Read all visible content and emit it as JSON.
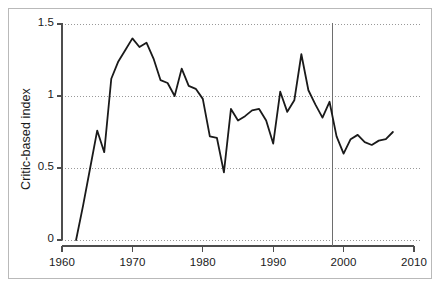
{
  "chart_data": {
    "type": "line",
    "title": "",
    "subtitle": "",
    "xlabel": "",
    "ylabel": "Critic-based index",
    "xlim": [
      1960,
      2010
    ],
    "ylim": [
      0,
      1.5
    ],
    "xticks": [
      1960,
      1970,
      1980,
      1990,
      2000,
      2010
    ],
    "xtick_labels": [
      "1960",
      "1970",
      "1980",
      "1990",
      "2000",
      "2010"
    ],
    "yticks": [
      0,
      0.5,
      1,
      1.5
    ],
    "ytick_labels": [
      "0",
      "0.5",
      "1",
      "1.5"
    ],
    "grid": "horizontal-dotted",
    "legend": "none",
    "line_color": "#1a1a1a",
    "grid_color": "#999999",
    "axis_color": "#4d4d4d",
    "frame_color": "#b9b9b9",
    "background": "#ffffff",
    "annotations": [
      {
        "name": "vertical-reference-line",
        "type": "vline",
        "x": 1998.4,
        "color": "#6e6e6e",
        "label": ""
      }
    ],
    "x": [
      1962,
      1963,
      1964,
      1965,
      1966,
      1967,
      1968,
      1969,
      1970,
      1971,
      1972,
      1973,
      1974,
      1975,
      1976,
      1977,
      1978,
      1979,
      1980,
      1981,
      1982,
      1983,
      1984,
      1985,
      1986,
      1987,
      1988,
      1989,
      1990,
      1991,
      1992,
      1993,
      1994,
      1995,
      1996,
      1997,
      1998,
      1999,
      2000,
      2001,
      2002,
      2003,
      2004,
      2005,
      2006,
      2007
    ],
    "values": [
      0.0,
      0.24,
      0.5,
      0.76,
      0.61,
      1.12,
      1.24,
      1.32,
      1.4,
      1.34,
      1.37,
      1.26,
      1.11,
      1.09,
      1.0,
      1.19,
      1.07,
      1.05,
      0.98,
      0.72,
      0.71,
      0.47,
      0.91,
      0.83,
      0.86,
      0.9,
      0.91,
      0.83,
      0.67,
      1.03,
      0.89,
      0.97,
      1.29,
      1.04,
      0.94,
      0.85,
      0.96,
      0.72,
      0.6,
      0.7,
      0.73,
      0.68,
      0.66,
      0.69,
      0.7,
      0.75
    ],
    "series_name": "Critic-based index"
  },
  "axis": {
    "y_label": "Critic-based index"
  }
}
